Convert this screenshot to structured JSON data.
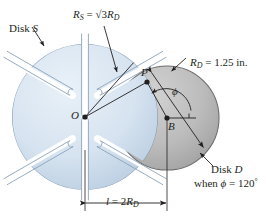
{
  "figure": {
    "background": "#ffffff"
  },
  "colors": {
    "disk_s_fill": "#d6e3f0",
    "disk_s_edge": "#7d94ad",
    "disk_d_fill": "#b9b9b9",
    "disk_d_edge": "#6e6e6e",
    "slot_fill": "#ffffff",
    "ink": "#231f20",
    "dashed": "#3a3a5a"
  },
  "labels": {
    "disk_s": {
      "text_prefix": "Disk ",
      "text_italic": "S",
      "full": "Disk S"
    },
    "disk_d": {
      "text_prefix": "Disk ",
      "text_italic": "D",
      "full": "Disk D"
    },
    "disk_d_condition": {
      "full": "when ϕ = 120°",
      "angle_symbol": "ϕ",
      "angle_value": "120",
      "angle_unit": "°",
      "when_word": "when"
    },
    "radius_s": {
      "full": "R_S = √3 R_D",
      "var": "R",
      "sub": "S",
      "eq": " = ",
      "sqrt": "√3",
      "rhs_var": "R",
      "rhs_sub": "D"
    },
    "radius_d": {
      "full": "R_D = 1.25 in.",
      "var": "R",
      "sub": "D",
      "eq": " = ",
      "value": "1.25",
      "unit": "in."
    },
    "length_l": {
      "full": "l = 2R_D",
      "var": "l",
      "eq": " = ",
      "coef": "2",
      "rhs_var": "R",
      "rhs_sub": "D"
    },
    "point_o": "O",
    "point_p": "P",
    "point_b": "B",
    "angle_phi": "ϕ"
  },
  "geometry": {
    "disk_s": {
      "center_x": 85,
      "center_y": 117,
      "radius": 73,
      "slot_count": 6,
      "slot_note": "radial slots with rounded ends, open at rim"
    },
    "disk_d": {
      "center_x": 167,
      "center_y": 118,
      "radius": 52
    },
    "pin_p": {
      "x": 147,
      "y": 82
    },
    "dashed_arc_note": "dashed circle = path traced by pin P about B",
    "dimension_l": {
      "from_x": 85,
      "to_x": 167,
      "y": 203
    }
  },
  "values": {
    "R_D_inches": 1.25,
    "R_S_over_R_D": 1.732,
    "l_over_R_D": 2,
    "phi_degrees": 120,
    "slot_count": 6
  }
}
